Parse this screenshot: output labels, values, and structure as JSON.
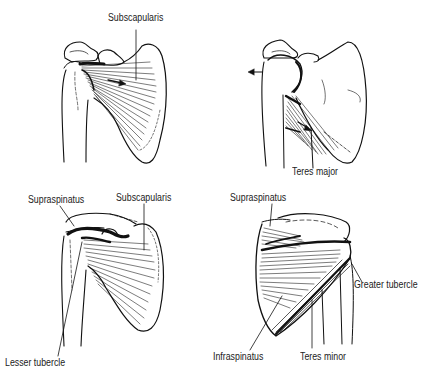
{
  "figure": {
    "panels": [
      {
        "id": "anterior-subscapularis",
        "labels": [
          {
            "text": "Subscapularis",
            "x": 108,
            "y": 17
          }
        ],
        "arrows": [
          "medial-arrow-on-muscle"
        ]
      },
      {
        "id": "anterior-teres-major",
        "labels": [
          {
            "text": "Teres major",
            "x": 292,
            "y": 170
          }
        ],
        "arrows": [
          "lateral-arrow-on-humerus",
          "oblique-arrow-on-muscle"
        ]
      },
      {
        "id": "anterior-supraspinatus-subscapularis",
        "labels": [
          {
            "text": "Supraspinatus",
            "x": 28,
            "y": 194
          },
          {
            "text": "Subscapularis",
            "x": 116,
            "y": 192
          },
          {
            "text": "Lesser tubercle",
            "x": 5,
            "y": 358
          }
        ]
      },
      {
        "id": "posterior-rotator-cuff",
        "labels": [
          {
            "text": "Supraspinatus",
            "x": 230,
            "y": 192
          },
          {
            "text": "Greater tubercle",
            "x": 353,
            "y": 280
          },
          {
            "text": "Infraspinatus",
            "x": 213,
            "y": 351
          },
          {
            "text": "Teres minor",
            "x": 300,
            "y": 351
          }
        ]
      }
    ],
    "colors": {
      "ink": "#111111",
      "background": "#ffffff"
    }
  }
}
